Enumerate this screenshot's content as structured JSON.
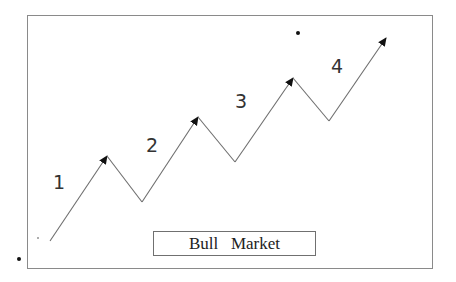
{
  "diagram": {
    "title_label": "Bull   Market",
    "waves": [
      {
        "label": "1",
        "x": 53,
        "y": 173
      },
      {
        "label": "2",
        "x": 146,
        "y": 136
      },
      {
        "label": "3",
        "x": 235,
        "y": 92
      },
      {
        "label": "4",
        "x": 331,
        "y": 57
      }
    ],
    "path_points": [
      [
        50,
        241
      ],
      [
        107,
        156
      ],
      [
        142,
        202
      ],
      [
        198,
        117
      ],
      [
        235,
        162
      ],
      [
        293,
        78
      ],
      [
        329,
        121
      ],
      [
        386,
        38
      ]
    ],
    "arrow_tips": [
      [
        107,
        156
      ],
      [
        198,
        117
      ],
      [
        293,
        78
      ],
      [
        386,
        38
      ]
    ],
    "colors": {
      "line": "#6e6e6e",
      "arrowhead": "#111111",
      "frame": "#8a8a8a",
      "text": "#333333"
    }
  }
}
